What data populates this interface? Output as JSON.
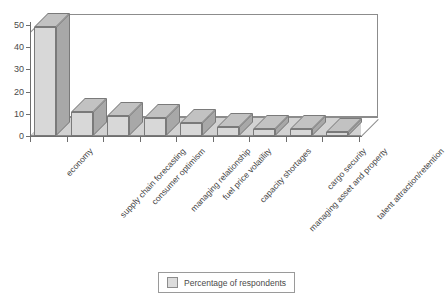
{
  "chart_data": {
    "type": "bar",
    "title": "",
    "subtitle": "",
    "xlabel": "",
    "ylabel": "",
    "ylim": [
      0,
      50
    ],
    "yticks": [
      0,
      10,
      20,
      30,
      40,
      50
    ],
    "grid": false,
    "three_d": true,
    "legend_position": "bottom-center",
    "categories": [
      "economy",
      "supply chain forecasting",
      "consumer optimism",
      "managing relationship",
      "fuel price volatility",
      "capacity shortages",
      "managing asset and property",
      "cargo security",
      "talent attraction/retention"
    ],
    "series": [
      {
        "name": "Percentage of respondents",
        "values": [
          49,
          11,
          9,
          8,
          6,
          4,
          3,
          3,
          2
        ]
      }
    ]
  },
  "legend": {
    "entries": [
      {
        "label": "Percentage of respondents",
        "color": "#dcdcdc"
      }
    ]
  },
  "colors": {
    "bar_front": "#d8d8d8",
    "bar_side": "#a8a8a8",
    "bar_top": "#c2c2c2",
    "floor": "#d2d2d2",
    "axis": "#6e6e6e",
    "frame": "#8c8c8c",
    "text": "#4a4a4a",
    "background": "#ffffff"
  }
}
